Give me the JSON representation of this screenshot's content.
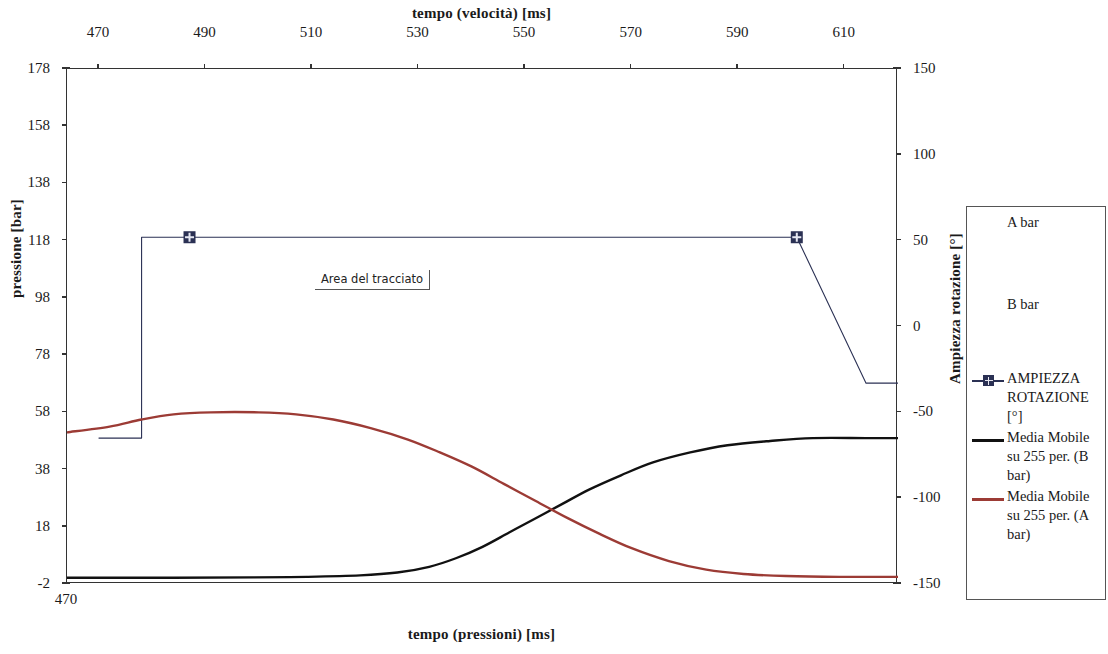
{
  "chart_data": {
    "type": "line",
    "title": "",
    "xlabel_top": "tempo (velocità) [ms]",
    "xlabel_bottom": "tempo (pressioni) [ms]",
    "ylabel_left": "pressione [bar]",
    "ylabel_right": "Ampiezza rotazione [°]",
    "grid": false,
    "legend_position": "right",
    "axes": {
      "top": {
        "label": "tempo (velocità) [ms]",
        "ticks": [
          470,
          490,
          510,
          530,
          550,
          570,
          590,
          610
        ],
        "range": [
          464,
          620
        ]
      },
      "bottom": {
        "label": "tempo (pressioni) [ms]",
        "ticks": [
          470
        ],
        "range": [
          470,
          626
        ]
      },
      "left": {
        "label": "pressione [bar]",
        "ticks": [
          -2,
          18,
          38,
          58,
          78,
          98,
          118,
          138,
          158,
          178
        ],
        "range": [
          -2,
          178
        ]
      },
      "right": {
        "label": "Ampiezza rotazione [°]",
        "ticks": [
          -150,
          -100,
          -50,
          0,
          50,
          100,
          150
        ],
        "range": [
          -150,
          150
        ]
      }
    },
    "annotation": {
      "text": "Area del tracciato",
      "x_ms": 528,
      "y_bar": 104
    },
    "series": [
      {
        "name": "A bar",
        "axis": "left",
        "color": "#b33",
        "visible_line": false,
        "note": "raw trace, rendered beneath moving average"
      },
      {
        "name": "B bar",
        "axis": "left",
        "color": "#222",
        "visible_line": false,
        "note": "raw trace, rendered beneath moving average"
      },
      {
        "name": "AMPIEZZA ROTAZIONE [°]",
        "axis": "right",
        "color": "#2b3154",
        "marker": "square-plus",
        "points": [
          {
            "x": 470,
            "y_deg": -65
          },
          {
            "x": 478,
            "y_deg": -65
          },
          {
            "x": 478,
            "y_deg": 52
          },
          {
            "x": 487,
            "y_deg": 52
          },
          {
            "x": 601,
            "y_deg": 52
          },
          {
            "x": 614,
            "y_deg": -33
          },
          {
            "x": 626,
            "y_deg": -33
          }
        ],
        "marker_points": [
          {
            "x": 487,
            "y_deg": 52
          },
          {
            "x": 601,
            "y_deg": 52
          }
        ]
      },
      {
        "name": "Media Mobile su 255 per. (B bar)",
        "axis": "left",
        "color": "#111111",
        "points": [
          {
            "x": 470,
            "y_bar": 0.2
          },
          {
            "x": 490,
            "y_bar": 0.2
          },
          {
            "x": 505,
            "y_bar": 0.3
          },
          {
            "x": 515,
            "y_bar": 0.5
          },
          {
            "x": 525,
            "y_bar": 1.0
          },
          {
            "x": 532,
            "y_bar": 2.0
          },
          {
            "x": 538,
            "y_bar": 4.0
          },
          {
            "x": 543,
            "y_bar": 7.0
          },
          {
            "x": 548,
            "y_bar": 11.0
          },
          {
            "x": 553,
            "y_bar": 16.0
          },
          {
            "x": 558,
            "y_bar": 21.0
          },
          {
            "x": 563,
            "y_bar": 26.0
          },
          {
            "x": 568,
            "y_bar": 31.0
          },
          {
            "x": 574,
            "y_bar": 36.0
          },
          {
            "x": 580,
            "y_bar": 40.5
          },
          {
            "x": 587,
            "y_bar": 44.0
          },
          {
            "x": 594,
            "y_bar": 46.5
          },
          {
            "x": 602,
            "y_bar": 48.0
          },
          {
            "x": 610,
            "y_bar": 49.0
          },
          {
            "x": 620,
            "y_bar": 49.0
          },
          {
            "x": 626,
            "y_bar": 49.0
          }
        ]
      },
      {
        "name": "Media Mobile su 255 per. (A bar)",
        "axis": "left",
        "color": "#9c3b35",
        "points": [
          {
            "x": 470,
            "y_bar": 51.0
          },
          {
            "x": 478,
            "y_bar": 53.0
          },
          {
            "x": 484,
            "y_bar": 55.5
          },
          {
            "x": 490,
            "y_bar": 57.3
          },
          {
            "x": 497,
            "y_bar": 58.0
          },
          {
            "x": 506,
            "y_bar": 58.0
          },
          {
            "x": 513,
            "y_bar": 57.3
          },
          {
            "x": 520,
            "y_bar": 55.5
          },
          {
            "x": 527,
            "y_bar": 52.5
          },
          {
            "x": 534,
            "y_bar": 48.5
          },
          {
            "x": 540,
            "y_bar": 44.0
          },
          {
            "x": 546,
            "y_bar": 39.0
          },
          {
            "x": 552,
            "y_bar": 33.0
          },
          {
            "x": 558,
            "y_bar": 27.0
          },
          {
            "x": 564,
            "y_bar": 21.0
          },
          {
            "x": 570,
            "y_bar": 15.5
          },
          {
            "x": 576,
            "y_bar": 10.5
          },
          {
            "x": 583,
            "y_bar": 6.0
          },
          {
            "x": 590,
            "y_bar": 3.0
          },
          {
            "x": 597,
            "y_bar": 1.5
          },
          {
            "x": 605,
            "y_bar": 0.8
          },
          {
            "x": 615,
            "y_bar": 0.5
          },
          {
            "x": 626,
            "y_bar": 0.5
          }
        ]
      }
    ]
  },
  "top_axis": {
    "title": "tempo (velocità) [ms]",
    "ticks": [
      "470",
      "490",
      "510",
      "530",
      "550",
      "570",
      "590",
      "610"
    ]
  },
  "bottom_axis": {
    "title": "tempo (pressioni) [ms]",
    "ticks": [
      "470"
    ]
  },
  "left_axis": {
    "title": "pressione [bar]",
    "ticks": [
      "178",
      "158",
      "138",
      "118",
      "98",
      "78",
      "58",
      "38",
      "18",
      "-2"
    ]
  },
  "right_axis": {
    "title": "Ampiezza rotazione [°]",
    "ticks": [
      "150",
      "100",
      "50",
      "0",
      "-50",
      "-100",
      "-150"
    ]
  },
  "annotation": {
    "text": "Area del tracciato"
  },
  "legend": {
    "items": [
      {
        "label": "A bar",
        "marker": "none",
        "color": "#b33"
      },
      {
        "label": "B bar",
        "marker": "none",
        "color": "#222"
      },
      {
        "label": "AMPIEZZA ROTAZIONE [°]",
        "marker": "line-square",
        "color": "#2b3154"
      },
      {
        "label": "Media Mobile su 255 per. (B bar)",
        "marker": "line",
        "color": "#111111"
      },
      {
        "label": "Media Mobile su 255 per. (A bar)",
        "marker": "line",
        "color": "#9c3b35"
      }
    ]
  }
}
